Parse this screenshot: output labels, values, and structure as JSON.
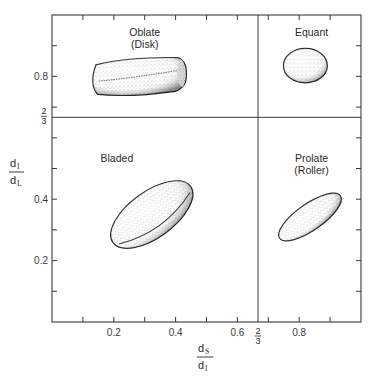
{
  "diagram": {
    "x_axis": {
      "label_numerator": "d",
      "label_numerator_sub": "S",
      "label_denominator": "d",
      "label_denominator_sub": "I",
      "range": [
        0,
        1.0
      ],
      "tick_step": 0.1,
      "tick_labels": [
        {
          "value": 0.2,
          "text": "0.2"
        },
        {
          "value": 0.4,
          "text": "0.4"
        },
        {
          "value": 0.6,
          "text": "0.6"
        },
        {
          "value": 0.8,
          "text": "0.8"
        }
      ],
      "divider": {
        "value": 0.6667,
        "num": "2",
        "den": "3"
      }
    },
    "y_axis": {
      "label_numerator": "d",
      "label_numerator_sub": "I",
      "label_denominator": "d",
      "label_denominator_sub": "L",
      "range": [
        0,
        1.0
      ],
      "tick_step": 0.1,
      "tick_labels": [
        {
          "value": 0.2,
          "text": "0.2"
        },
        {
          "value": 0.4,
          "text": "0.4"
        },
        {
          "value": 0.8,
          "text": "0.8"
        }
      ],
      "divider": {
        "value": 0.6667,
        "num": "2",
        "den": "3"
      }
    },
    "regions": [
      {
        "name": "Oblate",
        "sub": "(Disk)",
        "label_at": [
          0.3,
          0.93
        ],
        "quadrant": "top-left"
      },
      {
        "name": "Equant",
        "sub": "",
        "label_at": [
          0.84,
          0.93
        ],
        "quadrant": "top-right"
      },
      {
        "name": "Bladed",
        "sub": "",
        "label_at": [
          0.21,
          0.52
        ],
        "quadrant": "bottom-left"
      },
      {
        "name": "Prolate",
        "sub": "(Roller)",
        "label_at": [
          0.84,
          0.52
        ],
        "quadrant": "bottom-right"
      }
    ],
    "particles": [
      {
        "name": "oblate-particle",
        "shape": "disk",
        "center": [
          0.28,
          0.8
        ],
        "extent": [
          0.155,
          0.058
        ],
        "rotation": -3
      },
      {
        "name": "equant-particle",
        "shape": "sphere",
        "center": [
          0.82,
          0.835
        ],
        "extent": [
          0.071,
          0.056
        ],
        "rotation": 0
      },
      {
        "name": "bladed-particle",
        "shape": "blade",
        "center": [
          0.323,
          0.35
        ],
        "extent": [
          0.155,
          0.075
        ],
        "rotation": -36
      },
      {
        "name": "prolate-particle",
        "shape": "roller",
        "center": [
          0.835,
          0.342
        ],
        "extent": [
          0.12,
          0.043
        ],
        "rotation": -35
      }
    ]
  }
}
